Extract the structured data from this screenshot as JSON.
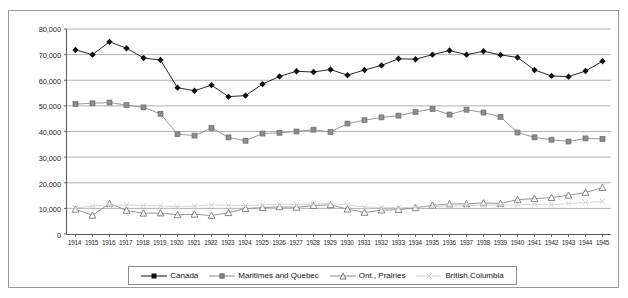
{
  "chart_data": {
    "type": "line",
    "title": "",
    "xlabel": "",
    "ylabel": "",
    "grid": true,
    "legend_position": "bottom",
    "ylim": [
      0,
      80000
    ],
    "ytick_labels": [
      "80,000",
      "70,000",
      "60,000",
      "50,000",
      "40,000",
      "30,000",
      "20,000",
      "10,000",
      "0"
    ],
    "ytick_values": [
      80000,
      70000,
      60000,
      50000,
      40000,
      30000,
      20000,
      10000,
      0
    ],
    "categories": [
      "1914",
      "1915",
      "1916",
      "1917",
      "1918",
      "1919",
      "1920",
      "1921",
      "1922",
      "1923",
      "1924",
      "1925",
      "1926",
      "1927",
      "1928",
      "1929",
      "1930",
      "1931",
      "1932",
      "1933",
      "1934",
      "1935",
      "1936",
      "1937",
      "1938",
      "1939",
      "1940",
      "1941",
      "1942",
      "1943",
      "1944",
      "1945"
    ],
    "series": [
      {
        "name": "Canada",
        "marker": "diamond",
        "color": "#111111",
        "values": [
          71800,
          70000,
          75000,
          72500,
          68700,
          67900,
          57100,
          55900,
          58100,
          53600,
          54000,
          58500,
          61500,
          63500,
          63200,
          64200,
          62000,
          64000,
          65800,
          68400,
          68200,
          70000,
          71600,
          70000,
          71300,
          69900,
          68900,
          64000,
          61700,
          61400,
          63600,
          67400
        ]
      },
      {
        "name": "Maritimes and Quebec",
        "marker": "square",
        "color": "#8c8c8c",
        "values": [
          50700,
          51000,
          51300,
          50300,
          49400,
          46900,
          39000,
          38400,
          41400,
          37700,
          36400,
          39200,
          39500,
          40000,
          40700,
          39800,
          43100,
          44400,
          45500,
          46200,
          47600,
          48800,
          46600,
          48500,
          47400,
          45700,
          39600,
          37700,
          36800,
          36100,
          37300,
          37100
        ]
      },
      {
        "name": "Ont., Prairies",
        "marker": "triangle",
        "color": "#6a6a6a",
        "values": [
          9600,
          7300,
          11900,
          9200,
          8100,
          8200,
          7500,
          7700,
          7200,
          8300,
          9900,
          10300,
          10600,
          10400,
          11100,
          11400,
          9700,
          8400,
          9300,
          9500,
          10200,
          11200,
          11700,
          11800,
          12100,
          11900,
          13400,
          13800,
          14200,
          15100,
          16200,
          18100
        ]
      },
      {
        "name": "British Columbia",
        "marker": "cross",
        "color": "#d2d2d2",
        "values": [
          10200,
          10900,
          11100,
          11300,
          11100,
          11000,
          10600,
          10900,
          11400,
          11200,
          11100,
          11400,
          11700,
          11500,
          11700,
          12000,
          11300,
          10600,
          10300,
          10200,
          10500,
          10700,
          10900,
          11100,
          11300,
          11200,
          11400,
          11600,
          11400,
          11900,
          12300,
          12700
        ]
      }
    ]
  },
  "legend": {
    "items": [
      {
        "label": "Canada",
        "marker": "diamond"
      },
      {
        "label": "Maritimes and Quebec",
        "marker": "square"
      },
      {
        "label": "Ont., Prairies",
        "marker": "triangle"
      },
      {
        "label": "British Columbia",
        "marker": "cross"
      }
    ]
  }
}
